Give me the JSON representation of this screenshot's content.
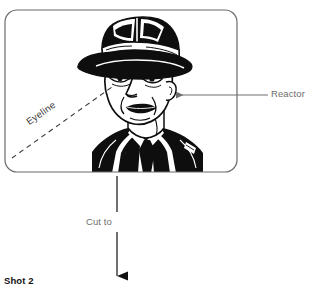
{
  "diagram": {
    "title_label": "Shot 2",
    "panel": {
      "name": "shot-panel",
      "frame_color": "#6b6b6b",
      "illustration": "man-in-fedora-hat-bust-line-art",
      "bounds": {
        "x": 4,
        "y": 9,
        "width": 234,
        "height": 164,
        "radius": 13
      }
    },
    "annotations": [
      {
        "id": "reactor",
        "label": "Reactor",
        "color": "#6e6e6e",
        "type": "leader-arrow",
        "arrow_direction": "left",
        "points_to": "characters-ear",
        "line": {
          "x1": 268,
          "y1": 95,
          "x2": 172,
          "y2": 95
        }
      },
      {
        "id": "eyeline",
        "label": "Eyeline",
        "color": "#3a3a3a",
        "type": "dashed-sightline",
        "rotation_deg": -35,
        "line": {
          "x1": 12,
          "y1": 158,
          "x2": 112,
          "y2": 87
        }
      },
      {
        "id": "cut-to",
        "label": "Cut to",
        "color": "#6e6e6e",
        "type": "transition-arrow",
        "arrow_direction": "down",
        "line": {
          "x1": 117,
          "y1": 176,
          "x2": 117,
          "y2": 287
        }
      }
    ],
    "colors": {
      "ink": "#121212",
      "frame": "#6b6b6b",
      "annotation": "#6e6e6e",
      "eyeline": "#3a3a3a",
      "background": "#ffffff"
    }
  }
}
